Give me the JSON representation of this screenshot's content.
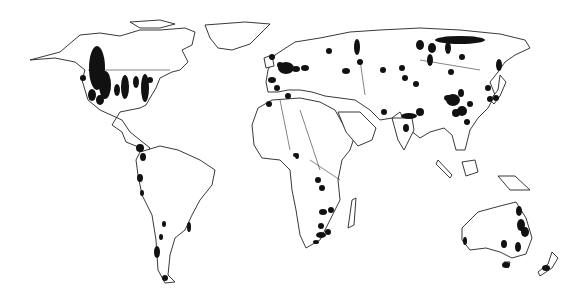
{
  "map": {
    "type": "world-distribution-map",
    "colors": {
      "background": "#ffffff",
      "outline": "#222222",
      "marker": "#111111"
    },
    "marked_regions": [
      {
        "region": "North America - Rocky Mountains/Canada",
        "spots": [
          [
            97,
            68,
            8,
            22
          ],
          [
            105,
            85,
            6,
            14
          ],
          [
            92,
            95,
            4,
            6
          ],
          [
            83,
            78,
            3,
            3
          ],
          [
            100,
            100,
            4,
            5
          ],
          [
            117,
            90,
            3,
            6
          ]
        ]
      },
      {
        "region": "North America - Eastern US",
        "spots": [
          [
            125,
            87,
            4,
            12
          ],
          [
            136,
            82,
            3,
            6
          ],
          [
            145,
            88,
            4,
            14
          ],
          [
            150,
            80,
            3,
            3
          ]
        ]
      },
      {
        "region": "Central America",
        "spots": [
          [
            140,
            148,
            4,
            4
          ]
        ]
      },
      {
        "region": "South America - Andes",
        "spots": [
          [
            143,
            157,
            3,
            4
          ],
          [
            140,
            178,
            3,
            4
          ],
          [
            142,
            193,
            2,
            3
          ],
          [
            164,
            224,
            2,
            3
          ],
          [
            161,
            237,
            2,
            3
          ],
          [
            157,
            252,
            3,
            6
          ],
          [
            165,
            278,
            3,
            3
          ]
        ]
      },
      {
        "region": "South America - Southeast Brazil",
        "spots": [
          [
            189,
            227,
            2,
            5
          ]
        ]
      },
      {
        "region": "Europe",
        "spots": [
          [
            272,
            57,
            3,
            3
          ],
          [
            280,
            65,
            3,
            3
          ],
          [
            286,
            68,
            8,
            6
          ],
          [
            296,
            69,
            4,
            3
          ],
          [
            305,
            68,
            4,
            3
          ],
          [
            272,
            80,
            4,
            3
          ],
          [
            277,
            88,
            3,
            3
          ],
          [
            288,
            96,
            3,
            3
          ],
          [
            269,
            104,
            3,
            3
          ]
        ]
      },
      {
        "region": "Russia/Urals",
        "spots": [
          [
            329,
            51,
            3,
            3
          ],
          [
            357,
            47,
            3,
            8
          ],
          [
            360,
            62,
            3,
            3
          ],
          [
            346,
            71,
            4,
            3
          ],
          [
            383,
            70,
            3,
            3
          ]
        ]
      },
      {
        "region": "Siberia",
        "spots": [
          [
            420,
            45,
            4,
            5
          ],
          [
            432,
            48,
            4,
            5
          ],
          [
            430,
            60,
            3,
            6
          ],
          [
            448,
            48,
            3,
            6
          ],
          [
            460,
            40,
            25,
            4
          ],
          [
            462,
            57,
            3,
            3
          ]
        ]
      },
      {
        "region": "Central Asia",
        "spots": [
          [
            402,
            68,
            3,
            3
          ],
          [
            405,
            78,
            3,
            3
          ],
          [
            416,
            84,
            3,
            3
          ],
          [
            451,
            72,
            3,
            3
          ]
        ]
      },
      {
        "region": "China/East Asia",
        "spots": [
          [
            448,
            98,
            4,
            3
          ],
          [
            453,
            100,
            7,
            6
          ],
          [
            461,
            93,
            3,
            4
          ],
          [
            470,
            104,
            3,
            3
          ],
          [
            456,
            113,
            4,
            4
          ],
          [
            462,
            111,
            5,
            5
          ],
          [
            467,
            122,
            3,
            3
          ],
          [
            488,
            88,
            3,
            3
          ],
          [
            496,
            98,
            3,
            3
          ],
          [
            499,
            65,
            3,
            6
          ],
          [
            490,
            99,
            3,
            3
          ]
        ]
      },
      {
        "region": "South Asia",
        "spots": [
          [
            409,
            116,
            8,
            3
          ],
          [
            420,
            112,
            4,
            4
          ],
          [
            406,
            128,
            3,
            4
          ],
          [
            384,
            112,
            3,
            3
          ]
        ]
      },
      {
        "region": "Africa",
        "spots": [
          [
            297,
            156,
            2,
            3
          ],
          [
            318,
            180,
            3,
            3
          ],
          [
            322,
            188,
            3,
            3
          ],
          [
            323,
            212,
            4,
            3
          ],
          [
            331,
            210,
            3,
            3
          ],
          [
            321,
            226,
            3,
            3
          ],
          [
            321,
            235,
            5,
            3
          ],
          [
            328,
            232,
            3,
            3
          ],
          [
            316,
            242,
            3,
            2
          ],
          [
            295,
            155,
            2,
            2
          ]
        ]
      },
      {
        "region": "Australia",
        "spots": [
          [
            519,
            211,
            3,
            5
          ],
          [
            521,
            225,
            4,
            6
          ],
          [
            525,
            232,
            4,
            5
          ],
          [
            504,
            244,
            3,
            4
          ],
          [
            518,
            247,
            3,
            5
          ],
          [
            465,
            241,
            2,
            4
          ],
          [
            506,
            265,
            4,
            3
          ]
        ]
      },
      {
        "region": "New Zealand",
        "spots": [
          [
            546,
            268,
            4,
            3
          ]
        ]
      }
    ]
  }
}
